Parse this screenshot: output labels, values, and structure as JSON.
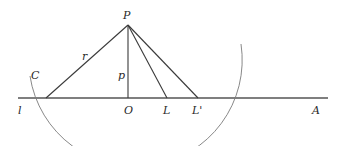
{
  "diagram": {
    "type": "geometry",
    "labels": {
      "P": "P",
      "C": "C",
      "r": "r",
      "p": "p",
      "l": "l",
      "O": "O",
      "L": "L",
      "L_prime": "L'",
      "A": "A"
    },
    "points": {
      "P": [
        128,
        25
      ],
      "C": [
        46,
        98
      ],
      "O": [
        128,
        98
      ],
      "L": [
        167,
        98
      ],
      "L_prime": [
        198,
        98
      ],
      "line_start": [
        18,
        98
      ],
      "line_end": [
        328,
        98
      ]
    },
    "segments": [
      {
        "from": "P",
        "to": "C",
        "label": "r"
      },
      {
        "from": "P",
        "to": "O",
        "label": "p"
      },
      {
        "from": "P",
        "to": "L"
      },
      {
        "from": "P",
        "to": "L_prime"
      }
    ],
    "arc": {
      "center": "P",
      "radius_through": "C"
    },
    "colors": {
      "line": "#3a3a3a",
      "baseline": "#555555",
      "arc": "#7a7a7a",
      "text": "#2a2a2a",
      "background": "#ffffff"
    }
  }
}
